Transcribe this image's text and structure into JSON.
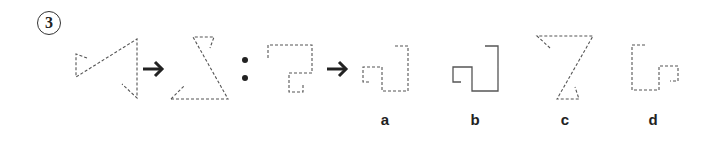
{
  "question": {
    "number": "3"
  },
  "sequence": {
    "separator": ":",
    "arrow_icon": "right-arrow-icon"
  },
  "options": [
    {
      "label": "a"
    },
    {
      "label": "b"
    },
    {
      "label": "c"
    },
    {
      "label": "d"
    }
  ],
  "colors": {
    "line": "#555555",
    "text": "#222222",
    "background": "#ffffff"
  }
}
